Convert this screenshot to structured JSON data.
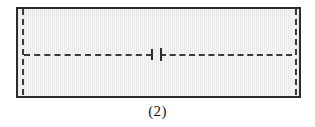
{
  "figure": {
    "caption": "(2)",
    "part_label": "rectangular-plate-section",
    "colors": {
      "outline": "#2b2b2b",
      "centerline": "#3a3a3a",
      "fill": "#e9e9e9",
      "background": "#ffffff",
      "caption_text": "#1a1a1a"
    },
    "geometry": {
      "outline_left": 17,
      "outline_top": 8,
      "outline_width": 283,
      "outline_height": 89
    },
    "elements": {
      "top_edge": "top-edge",
      "bottom_edge": "bottom-edge",
      "left_edge": "left-edge",
      "right_edge": "right-edge",
      "left_vertical_centerline": "left-vertical-centerline",
      "right_vertical_centerline": "right-vertical-centerline",
      "horizontal_centerline_left": "horizontal-centerline-left-segment",
      "horizontal_centerline_right": "horizontal-centerline-right-segment",
      "break_tick_left": "break-tick-left",
      "break_tick_right": "break-tick-right"
    }
  }
}
